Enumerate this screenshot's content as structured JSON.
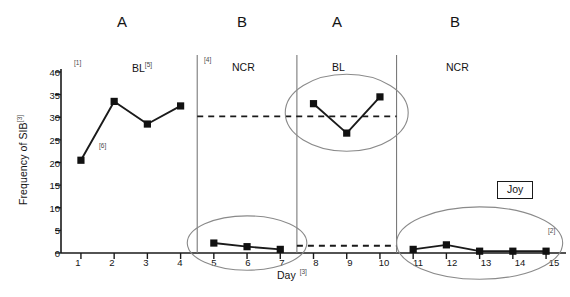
{
  "figure": {
    "participant_label": "Joy",
    "participant_callout": "[2]"
  },
  "conditions": [
    {
      "letter": "A",
      "x": 122
    },
    {
      "letter": "B",
      "x": 242
    },
    {
      "letter": "A",
      "x": 337
    },
    {
      "letter": "B",
      "x": 455
    }
  ],
  "phases": [
    {
      "name": "BL",
      "callout": "[5]",
      "x": 146
    },
    {
      "name": "NCR",
      "callout": "",
      "x": 248
    },
    {
      "name": "BL",
      "callout": "",
      "x": 345
    },
    {
      "name": "NCR",
      "callout": "",
      "x": 462
    }
  ],
  "callouts": [
    {
      "text": "[1]",
      "x": 76,
      "y": 62
    },
    {
      "text": "[6]",
      "x": 100,
      "y": 145
    },
    {
      "text": "[4]",
      "x": 205,
      "y": 58
    }
  ],
  "axes": {
    "ylabel": "Frequency of SIB",
    "ylabel_sup": "[3]",
    "xlabel": "Day",
    "xlabel_sup": "[3]",
    "yticks": [
      0,
      5,
      10,
      15,
      20,
      25,
      30,
      35,
      40
    ],
    "xticks": [
      1,
      2,
      3,
      4,
      5,
      6,
      7,
      8,
      9,
      10,
      11,
      12,
      13,
      14,
      15
    ]
  },
  "chart_data": {
    "type": "line",
    "title": "",
    "subtitle": "",
    "xlabel": "Day",
    "ylabel": "Frequency of SIB",
    "xlim": [
      0.4,
      15.6
    ],
    "ylim": [
      0,
      40
    ],
    "grid": false,
    "legend": false,
    "marker": "filled-square",
    "series": [
      {
        "name": "BL (A, days 1-4)",
        "phase": "BL",
        "condition": "A",
        "x": [
          1,
          2,
          3,
          4
        ],
        "values": [
          20.5,
          33.5,
          28.5,
          32.5
        ]
      },
      {
        "name": "NCR (B, days 5-7)",
        "phase": "NCR",
        "condition": "B",
        "x": [
          5,
          6,
          7
        ],
        "values": [
          2.2,
          1.4,
          0.8
        ]
      },
      {
        "name": "BL (A, days 8-10)",
        "phase": "BL",
        "condition": "A",
        "x": [
          8,
          9,
          10
        ],
        "values": [
          33.0,
          26.5,
          34.5
        ]
      },
      {
        "name": "NCR (B, days 11-15)",
        "phase": "NCR",
        "condition": "B",
        "x": [
          11,
          12,
          13,
          14,
          15
        ],
        "values": [
          0.8,
          1.8,
          0.4,
          0.4,
          0.4
        ]
      }
    ],
    "phase_dividers": [
      4.5,
      7.5,
      10.5
    ],
    "reference_lines": [
      {
        "y": 30.2,
        "from_x": 4.5,
        "to_x": 10.5,
        "style": "dashed"
      },
      {
        "y": 1.6,
        "from_x": 7.5,
        "to_x": 10.5,
        "style": "dashed"
      }
    ],
    "highlight_ellipses": [
      {
        "center_x": 6.0,
        "center_y": 2.2,
        "rx_days": 1.8,
        "ry_units": 6.0
      },
      {
        "center_x": 9.0,
        "center_y": 31.0,
        "rx_days": 1.85,
        "ry_units": 8.5
      },
      {
        "center_x": 13.0,
        "center_y": 2.2,
        "rx_days": 2.5,
        "ry_units": 8.0
      }
    ],
    "annotations": [
      {
        "text": "[1]",
        "x": 1.0,
        "y": 41.5
      },
      {
        "text": "[6]",
        "x": 1.75,
        "y": 23.5
      },
      {
        "text": "[4]",
        "x": 4.8,
        "y": 42.5
      },
      {
        "text": "[5]",
        "x": 3.6,
        "y": 41.0
      },
      {
        "text": "[2]",
        "x": 15.5,
        "y": 7.0
      }
    ]
  },
  "colors": {
    "axis": "#1a1a1a",
    "line": "#1a1a1a",
    "marker": "#111111",
    "divider": "#7a7a7a",
    "ellipse": "#8a8a8a",
    "dashed": "#1a1a1a",
    "text": "#141414",
    "background": "#ffffff"
  }
}
